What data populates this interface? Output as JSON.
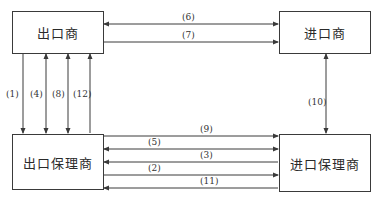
{
  "nodes": {
    "exporter": "出口商",
    "importer": "进口商",
    "export_factor": "出口保理商",
    "import_factor": "进口保理商"
  },
  "edges": [
    {
      "id": "1",
      "label": "(1)",
      "from": "exporter",
      "to": "export_factor",
      "direction": "down"
    },
    {
      "id": "4",
      "label": "(4)",
      "from": "exporter",
      "to": "export_factor",
      "direction": "both"
    },
    {
      "id": "8",
      "label": "(8)",
      "from": "exporter",
      "to": "export_factor",
      "direction": "both"
    },
    {
      "id": "12",
      "label": "(12)",
      "from": "export_factor",
      "to": "exporter",
      "direction": "up"
    },
    {
      "id": "6",
      "label": "(6)",
      "from": "exporter",
      "to": "importer",
      "direction": "both"
    },
    {
      "id": "7",
      "label": "(7)",
      "from": "exporter",
      "to": "importer",
      "direction": "right"
    },
    {
      "id": "10",
      "label": "(10)",
      "from": "importer",
      "to": "import_factor",
      "direction": "both"
    },
    {
      "id": "9",
      "label": "(9)",
      "from": "export_factor",
      "to": "import_factor",
      "direction": "right"
    },
    {
      "id": "5",
      "label": "(5)",
      "from": "export_factor",
      "to": "import_factor",
      "direction": "both"
    },
    {
      "id": "3",
      "label": "(3)",
      "from": "import_factor",
      "to": "export_factor",
      "direction": "left"
    },
    {
      "id": "2",
      "label": "(2)",
      "from": "export_factor",
      "to": "import_factor",
      "direction": "right"
    },
    {
      "id": "11",
      "label": "(11)",
      "from": "import_factor",
      "to": "export_factor",
      "direction": "left"
    }
  ],
  "colors": {
    "line": "#3a3a3a",
    "text": "#2a2a2a"
  }
}
